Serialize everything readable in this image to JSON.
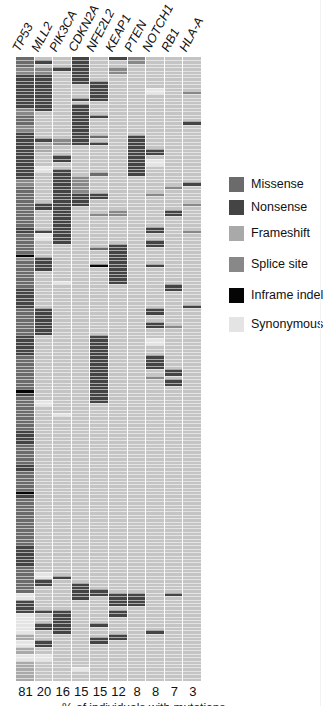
{
  "chart_data": {
    "type": "heatmap",
    "title": "",
    "xlabel": "% of individuals with mutations",
    "genes": [
      "TP53",
      "MLL2",
      "PIK3CA",
      "CDKN2A",
      "NFE2L2",
      "KEAP1",
      "PTEN",
      "NOTCH1",
      "RB1",
      "HLA-A"
    ],
    "percent_mutated": [
      81,
      20,
      16,
      15,
      15,
      12,
      8,
      8,
      7,
      3
    ],
    "n_samples_rows": 184,
    "legend_position": "right",
    "mutation_types": [
      {
        "key": "M",
        "label": "Missense",
        "color": "#6b6b6b"
      },
      {
        "key": "N",
        "label": "Nonsense",
        "color": "#444444"
      },
      {
        "key": "F",
        "label": "Frameshift",
        "color": "#a9a9a9"
      },
      {
        "key": "S",
        "label": "Splice site",
        "color": "#888888"
      },
      {
        "key": "I",
        "label": "Inframe indel",
        "color": "#050505"
      },
      {
        "key": "Y",
        "label": "Synonymous",
        "color": "#e4e4e4"
      }
    ],
    "background_color": "#c4c4c4",
    "segments": {
      "TP53": [
        [
          0,
          3,
          "M"
        ],
        [
          3,
          2,
          "S"
        ],
        [
          5,
          10,
          "N"
        ],
        [
          15,
          2,
          "S"
        ],
        [
          17,
          3,
          "M"
        ],
        [
          20,
          2,
          "S"
        ],
        [
          22,
          14,
          "N"
        ],
        [
          36,
          2,
          "S"
        ],
        [
          38,
          12,
          "M"
        ],
        [
          50,
          2,
          "N"
        ],
        [
          52,
          6,
          "M"
        ],
        [
          58,
          2,
          "S"
        ],
        [
          58,
          1,
          "I"
        ],
        [
          60,
          8,
          "M"
        ],
        [
          68,
          6,
          "N"
        ],
        [
          74,
          8,
          "M"
        ],
        [
          82,
          6,
          "N"
        ],
        [
          88,
          10,
          "M"
        ],
        [
          98,
          2,
          "N"
        ],
        [
          98,
          1,
          "I"
        ],
        [
          100,
          10,
          "M"
        ],
        [
          110,
          4,
          "N"
        ],
        [
          114,
          6,
          "M"
        ],
        [
          120,
          2,
          "N"
        ],
        [
          122,
          6,
          "M"
        ],
        [
          128,
          2,
          "N"
        ],
        [
          128,
          1,
          "I"
        ],
        [
          130,
          14,
          "M"
        ],
        [
          144,
          6,
          "N"
        ],
        [
          150,
          8,
          "M"
        ],
        [
          158,
          2,
          "Y"
        ],
        [
          160,
          4,
          "N"
        ],
        [
          164,
          6,
          "Y"
        ],
        [
          170,
          2,
          "F"
        ],
        [
          172,
          2,
          "Y"
        ],
        [
          174,
          2,
          "F"
        ],
        [
          176,
          2,
          "Y"
        ],
        [
          178,
          6,
          "F"
        ]
      ],
      "MLL2": [
        [
          1,
          1,
          "N"
        ],
        [
          3,
          2,
          "S"
        ],
        [
          5,
          11,
          "N"
        ],
        [
          24,
          1,
          "N"
        ],
        [
          25,
          3,
          "F"
        ],
        [
          32,
          2,
          "Y"
        ],
        [
          43,
          2,
          "N"
        ],
        [
          51,
          1,
          "N"
        ],
        [
          52,
          2,
          "Y"
        ],
        [
          59,
          4,
          "N"
        ],
        [
          74,
          8,
          "N"
        ],
        [
          101,
          2,
          "Y"
        ],
        [
          152,
          2,
          "Y"
        ],
        [
          154,
          2,
          "N"
        ],
        [
          163,
          1,
          "N"
        ],
        [
          167,
          2,
          "N"
        ],
        [
          172,
          2,
          "N"
        ],
        [
          176,
          2,
          "Y"
        ]
      ],
      "PIK3CA": [
        [
          3,
          1,
          "N"
        ],
        [
          24,
          2,
          "S"
        ],
        [
          29,
          2,
          "N"
        ],
        [
          33,
          22,
          "N"
        ],
        [
          66,
          1,
          "Y"
        ],
        [
          105,
          1,
          "Y"
        ],
        [
          153,
          1,
          "N"
        ],
        [
          163,
          6,
          "N"
        ],
        [
          168,
          2,
          "N"
        ]
      ],
      "CDKN2A": [
        [
          0,
          8,
          "N"
        ],
        [
          12,
          1,
          "N"
        ],
        [
          14,
          12,
          "N"
        ],
        [
          35,
          5,
          "S"
        ],
        [
          40,
          4,
          "N"
        ],
        [
          155,
          5,
          "N"
        ],
        [
          180,
          1,
          "Y"
        ]
      ],
      "NFE2L2": [
        [
          7,
          6,
          "N"
        ],
        [
          17,
          1,
          "N"
        ],
        [
          23,
          1,
          "M"
        ],
        [
          25,
          1,
          "N"
        ],
        [
          34,
          1,
          "M"
        ],
        [
          40,
          2,
          "N"
        ],
        [
          46,
          1,
          "S"
        ],
        [
          56,
          1,
          "M"
        ],
        [
          61,
          1,
          "I"
        ],
        [
          82,
          20,
          "N"
        ],
        [
          157,
          2,
          "N"
        ],
        [
          167,
          1,
          "N"
        ],
        [
          171,
          2,
          "N"
        ]
      ],
      "KEAP1": [
        [
          0,
          1,
          "N"
        ],
        [
          3,
          2,
          "S"
        ],
        [
          45,
          2,
          "S"
        ],
        [
          55,
          12,
          "N"
        ],
        [
          158,
          4,
          "N"
        ],
        [
          163,
          2,
          "N"
        ],
        [
          170,
          2,
          "N"
        ]
      ],
      "PTEN": [
        [
          0,
          2,
          "S"
        ],
        [
          23,
          12,
          "N"
        ],
        [
          158,
          4,
          "N"
        ]
      ],
      "NOTCH1": [
        [
          9,
          2,
          "Y"
        ],
        [
          27,
          2,
          "N"
        ],
        [
          30,
          2,
          "Y"
        ],
        [
          40,
          1,
          "S"
        ],
        [
          50,
          2,
          "N"
        ],
        [
          54,
          2,
          "N"
        ],
        [
          61,
          1,
          "N"
        ],
        [
          74,
          2,
          "N"
        ],
        [
          78,
          2,
          "N"
        ],
        [
          83,
          2,
          "Y"
        ],
        [
          88,
          4,
          "N"
        ],
        [
          94,
          1,
          "S"
        ],
        [
          169,
          1,
          "N"
        ]
      ],
      "RB1": [
        [
          38,
          1,
          "S"
        ],
        [
          45,
          2,
          "N"
        ],
        [
          67,
          2,
          "N"
        ],
        [
          79,
          1,
          "S"
        ],
        [
          92,
          2,
          "N"
        ],
        [
          95,
          2,
          "N"
        ],
        [
          158,
          1,
          "N"
        ]
      ],
      "HLA-A": [
        [
          10,
          1,
          "S"
        ],
        [
          19,
          1,
          "N"
        ],
        [
          37,
          1,
          "N"
        ],
        [
          43,
          1,
          "S"
        ],
        [
          51,
          1,
          "S"
        ],
        [
          73,
          1,
          "N"
        ]
      ]
    }
  },
  "legend": {
    "items": [
      {
        "label": "Missense",
        "color": "#6b6b6b"
      },
      {
        "label": "Nonsense",
        "color": "#444444"
      },
      {
        "label": "Frameshift",
        "color": "#a9a9a9"
      },
      {
        "label": "Splice site",
        "color": "#888888"
      },
      {
        "label": "Inframe indel",
        "color": "#050505"
      },
      {
        "label": "Synonymous",
        "color": "#e4e4e4"
      }
    ]
  },
  "header": {
    "genes": [
      "TP53",
      "MLL2",
      "PIK3CA",
      "CDKN2A",
      "NFE2L2",
      "KEAP1",
      "PTEN",
      "NOTCH1",
      "RB1",
      "HLA-A"
    ]
  },
  "footer": {
    "counts": [
      "81",
      "20",
      "16",
      "15",
      "15",
      "12",
      "8",
      "8",
      "7",
      "3"
    ],
    "caption": "% of individuals with mutations"
  }
}
